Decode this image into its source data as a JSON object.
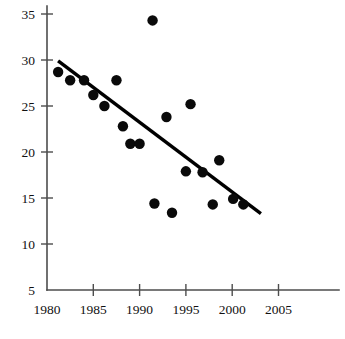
{
  "chart_data": {
    "type": "scatter",
    "title": "",
    "subtitle": "",
    "xlabel": "",
    "ylabel": "",
    "xlim": [
      1980,
      2006.5
    ],
    "ylim": [
      5,
      35.8
    ],
    "xticks": [
      1980,
      1985,
      1990,
      1995,
      2000,
      2005
    ],
    "xtick_labels": [
      "1980",
      "1985",
      "1990",
      "1995",
      "2000",
      "2005"
    ],
    "yticks": [
      5,
      10,
      15,
      20,
      25,
      30,
      35
    ],
    "ytick_labels": [
      "5",
      "10",
      "15",
      "20",
      "25",
      "30",
      "35"
    ],
    "grid": false,
    "legend": false,
    "legend_position": "none",
    "marker": {
      "shape": "circle",
      "color": "#0a0a0a",
      "size_px": 6.2
    },
    "series": [
      {
        "name": "observations",
        "type": "scatter",
        "color": "#0a0a0a",
        "points": [
          {
            "x": 1981.2,
            "y": 28.7
          },
          {
            "x": 1982.5,
            "y": 27.8
          },
          {
            "x": 1984.0,
            "y": 27.8
          },
          {
            "x": 1985.0,
            "y": 26.2
          },
          {
            "x": 1986.2,
            "y": 25.0
          },
          {
            "x": 1987.5,
            "y": 27.8
          },
          {
            "x": 1988.2,
            "y": 22.8
          },
          {
            "x": 1989.0,
            "y": 20.9
          },
          {
            "x": 1990.0,
            "y": 20.9
          },
          {
            "x": 1991.4,
            "y": 34.3
          },
          {
            "x": 1991.6,
            "y": 14.4
          },
          {
            "x": 1992.9,
            "y": 23.8
          },
          {
            "x": 1993.5,
            "y": 13.4
          },
          {
            "x": 1995.0,
            "y": 17.9
          },
          {
            "x": 1995.5,
            "y": 25.2
          },
          {
            "x": 1996.8,
            "y": 17.8
          },
          {
            "x": 1997.9,
            "y": 14.3
          },
          {
            "x": 1998.6,
            "y": 19.1
          },
          {
            "x": 2000.1,
            "y": 14.9
          },
          {
            "x": 2001.2,
            "y": 14.3
          }
        ]
      }
    ],
    "trend_line": {
      "name": "fitted-trend",
      "type": "line",
      "color": "#000000",
      "width_px": 3.4,
      "start": {
        "x": 1981.2,
        "y": 29.9
      },
      "end": {
        "x": 2003.1,
        "y": 13.3
      }
    }
  },
  "axes": {
    "x_axis_name": "x-axis",
    "y_axis_name": "y-axis"
  }
}
